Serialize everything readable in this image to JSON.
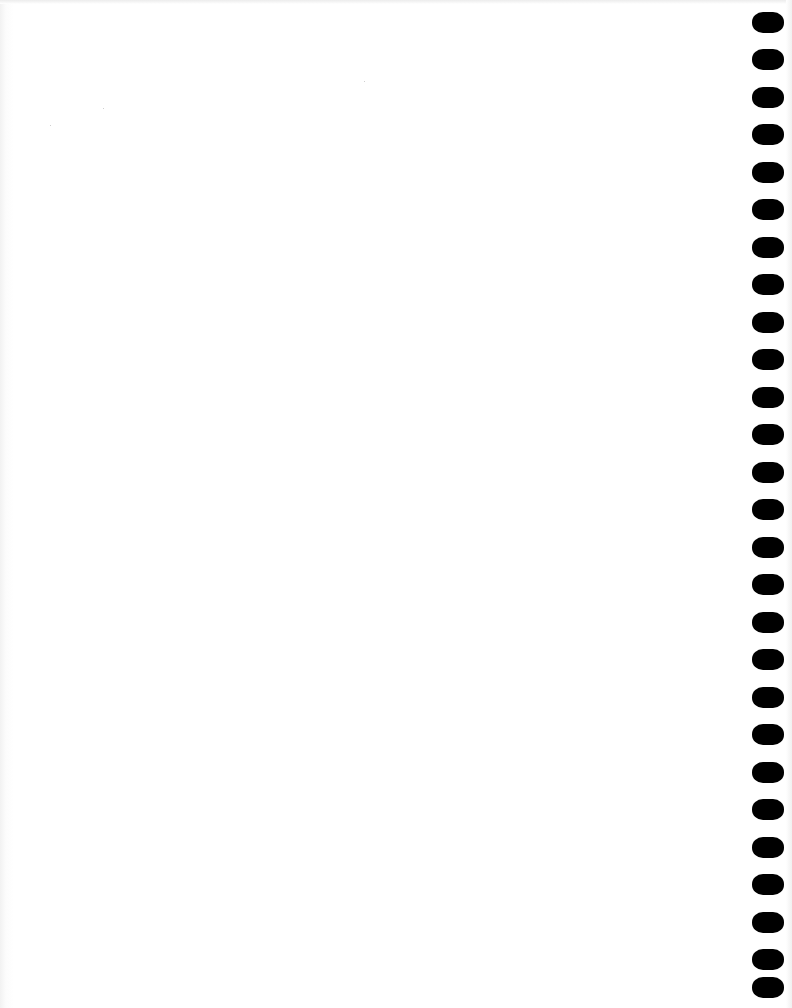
{
  "page": {
    "type": "blank-punched-sheet",
    "background_color": "#ffffff",
    "hole_color": "#000000",
    "hole_count": 27,
    "hole_side": "right",
    "holes": [
      {
        "top": 12
      },
      {
        "top": 49
      },
      {
        "top": 87
      },
      {
        "top": 124
      },
      {
        "top": 162
      },
      {
        "top": 199
      },
      {
        "top": 237
      },
      {
        "top": 274
      },
      {
        "top": 312
      },
      {
        "top": 349
      },
      {
        "top": 387
      },
      {
        "top": 424
      },
      {
        "top": 462
      },
      {
        "top": 499
      },
      {
        "top": 537
      },
      {
        "top": 574
      },
      {
        "top": 612
      },
      {
        "top": 649
      },
      {
        "top": 687
      },
      {
        "top": 724
      },
      {
        "top": 762
      },
      {
        "top": 799
      },
      {
        "top": 837
      },
      {
        "top": 874
      },
      {
        "top": 912
      },
      {
        "top": 949
      },
      {
        "top": 977
      }
    ]
  }
}
